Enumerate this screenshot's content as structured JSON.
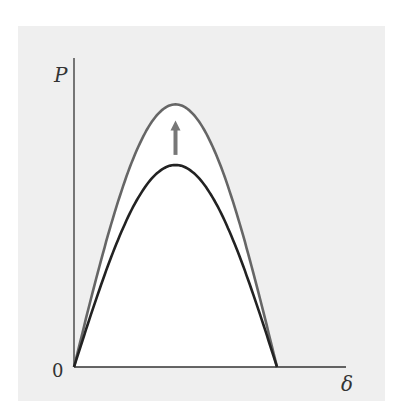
{
  "chart_data": {
    "type": "line",
    "title": "",
    "xlabel": "δ",
    "ylabel": "P",
    "origin_label": "0",
    "xlim": [
      0,
      1.34
    ],
    "ylim": [
      0,
      1.55
    ],
    "grid": false,
    "legend": "none",
    "series": [
      {
        "name": "upper-curve",
        "color": "#666666",
        "shape": "sin",
        "amplitude": 1.3,
        "x_end": 1.0
      },
      {
        "name": "lower-curve",
        "color": "#222222",
        "shape": "sin",
        "amplitude": 1.0,
        "x_end": 1.0
      }
    ],
    "annotations": [
      {
        "type": "arrow",
        "direction": "up",
        "x": 0.5,
        "from": 1.05,
        "to": 1.22,
        "color": "#777777",
        "meaning": "curve increases"
      }
    ]
  }
}
